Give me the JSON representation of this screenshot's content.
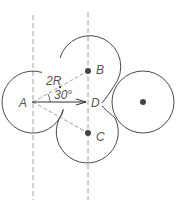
{
  "diagram": {
    "type": "geometry",
    "colors": {
      "stroke": "#4a4a4a",
      "dash": "#888888",
      "label": "#555555",
      "background": "#ffffff"
    },
    "labels": {
      "A": "A",
      "B": "B",
      "C": "C",
      "D": "D",
      "distance": "2R",
      "angle": "30°"
    },
    "circles": [
      {
        "id": "circle-a",
        "cx": 33,
        "cy": 102,
        "r": 31,
        "center_dot": false
      },
      {
        "id": "circle-b",
        "cx": 88,
        "cy": 71,
        "r": 31,
        "center_dot": true
      },
      {
        "id": "circle-c",
        "cx": 88,
        "cy": 133,
        "r": 31,
        "center_dot": true
      },
      {
        "id": "circle-right",
        "cx": 143,
        "cy": 102,
        "r": 31,
        "center_dot": true
      }
    ],
    "guides": [
      {
        "id": "dashed-vertical-left",
        "x": 33
      },
      {
        "id": "dashed-vertical-right",
        "x": 88
      }
    ]
  }
}
